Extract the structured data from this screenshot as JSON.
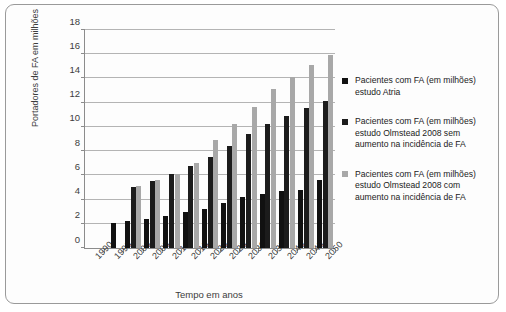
{
  "chart_data": {
    "type": "bar",
    "title": "",
    "xlabel": "Tempo em anos",
    "ylabel": "Portadores de FA em milhões",
    "categories": [
      "1990",
      "1995",
      "2000",
      "2005",
      "2010",
      "2015",
      "2020",
      "2025",
      "2030",
      "2035",
      "2040",
      "2045",
      "2050"
    ],
    "ylim": [
      0,
      18
    ],
    "ytick_values": [
      0,
      2,
      4,
      6,
      8,
      10,
      12,
      14,
      16,
      18
    ],
    "ytick_labels": [
      "0",
      "2",
      "4",
      "6",
      "8",
      "10",
      "12",
      "14",
      "16",
      "18"
    ],
    "grid": true,
    "legend_position": "right",
    "series": [
      {
        "name": "Pacientes com FA (em milhões) estudo Atria",
        "color": "#111111",
        "values": [
          null,
          2.1,
          2.25,
          2.4,
          2.65,
          2.95,
          3.25,
          3.75,
          4.25,
          4.5,
          4.7,
          4.8,
          5.6
        ]
      },
      {
        "name": "Pacientes com FA (em milhões) estudo Olmstead 2008 sem aumento na incidência de FA",
        "color": "#1c1c1c",
        "values": [
          null,
          null,
          5.05,
          5.5,
          6.1,
          6.75,
          7.5,
          8.4,
          9.4,
          10.2,
          10.9,
          11.6,
          12.1
        ]
      },
      {
        "name": "Pacientes com FA (em milhões) estudo Olmstead 2008 com aumento na incidência de FA",
        "color": "#a8a8a8",
        "values": [
          null,
          null,
          5.1,
          5.6,
          6.1,
          7.0,
          8.9,
          10.2,
          11.65,
          13.1,
          14.1,
          15.1,
          15.9
        ]
      }
    ]
  },
  "legend": {
    "entries": [
      {
        "label": "Pacientes com FA (em milhões) estudo Atria",
        "color": "#111111"
      },
      {
        "label": "Pacientes com FA (em milhões) estudo Olmstead 2008 sem aumento na incidência de FA",
        "color": "#1c1c1c"
      },
      {
        "label": "Pacientes com FA (em milhões) estudo Olmstead 2008 com aumento na incidência de FA",
        "color": "#a8a8a8"
      }
    ]
  }
}
